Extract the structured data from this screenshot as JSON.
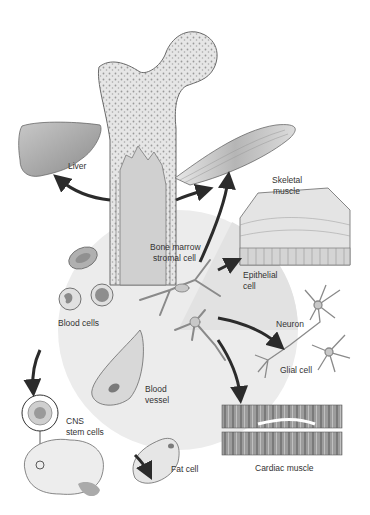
{
  "diagram": {
    "center_node": {
      "label_line1": "Bone marrow",
      "label_line2": "stromal cell"
    },
    "nodes": [
      {
        "id": "liver",
        "label": "Liver"
      },
      {
        "id": "skeletal-muscle",
        "label_line1": "Skeletal",
        "label_line2": "muscle"
      },
      {
        "id": "epithelial-cell",
        "label_line1": "Epithelial",
        "label_line2": "cell"
      },
      {
        "id": "neuron",
        "label": "Neuron"
      },
      {
        "id": "glial-cell",
        "label": "Glial cell"
      },
      {
        "id": "cardiac-muscle",
        "label": "Cardiac muscle"
      },
      {
        "id": "fat-cell",
        "label": "Fat cell"
      },
      {
        "id": "blood-vessel",
        "label_line1": "Blood",
        "label_line2": "vessel"
      },
      {
        "id": "blood-cells",
        "label": "Blood cells"
      },
      {
        "id": "cns-stem-cells",
        "label_line1": "CNS",
        "label_line2": "stem cells"
      }
    ],
    "structures": [
      "femur-bone",
      "marrow-cavity",
      "brain"
    ],
    "colors": {
      "outline": "#6a6a6a",
      "fill_light": "#e4e4e4",
      "fill_mid": "#bdbdbd",
      "arrow": "#2b2b2b",
      "halo": "#ececec"
    }
  }
}
